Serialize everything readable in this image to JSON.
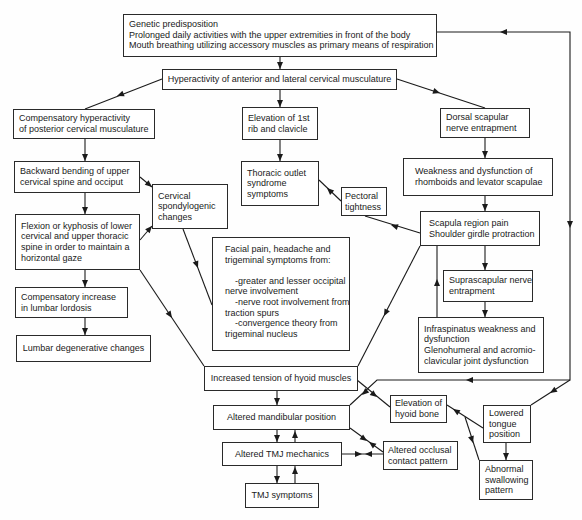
{
  "diagram": {
    "type": "flowchart",
    "boxes": {
      "root_causes": {
        "text": "Genetic predisposition\nProlonged daily activities with the upper extremities in front of the body\nMouth breathing utilizing accessory muscles as primary means of respiration"
      },
      "anterior_hyperactivity": {
        "text": "Hyperactivity of anterior and lateral cervical musculature"
      },
      "posterior_hyperactivity": {
        "text": "Compensatory hyperactivity\nof posterior cervical musculature"
      },
      "rib_elevation": {
        "text": "Elevation of 1st\nrib and clavicle"
      },
      "dorsal_scapular": {
        "text": "Dorsal scapular\nnerve entrapment"
      },
      "backward_bending": {
        "text": "Backward bending of upper\ncervical spine and occiput"
      },
      "thoracic_outlet": {
        "text": "Thoracic outlet\nsyndrome\nsymptoms"
      },
      "cervical_spondylogenic": {
        "text": "Cervical\nspondylogenic\nchanges"
      },
      "pectoral_tightness": {
        "text": "Pectoral\ntightness"
      },
      "rhomboid_weakness": {
        "text": "Weakness and dysfunction of\nrhomboids and levator scapulae"
      },
      "flexion_kyphosis": {
        "text": "Flexion or kyphosis of lower\ncervical and upper thoracic\nspine in order to maintain a\nhorizontal gaze"
      },
      "scapula_pain": {
        "text": "Scapula region pain\nShoulder girdle protraction"
      },
      "facial_pain": {
        "text": "Facial pain, headache and\ntrigeminal symptoms from:\n\n    -greater and lesser occipital\nnerve involvement\n    -nerve root involvement from\ntraction spurs\n    -convergence theory from\ntrigeminal nucleus"
      },
      "lumbar_lordosis": {
        "text": "Compensatory increase\nin lumbar lordosis"
      },
      "suprascapular": {
        "text": "Suprascapular nerve\nentrapment"
      },
      "infraspinatus": {
        "text": "Infraspinatus weakness and\ndysfunction\nGlenohumeral and acromio-\nclavicular joint dysfunction"
      },
      "lumbar_degenerative": {
        "text": "Lumbar degenerative changes"
      },
      "hyoid_tension": {
        "text": "Increased tension of hyoid muscles"
      },
      "mandibular_position": {
        "text": "Altered mandibular position"
      },
      "tmj_mechanics": {
        "text": "Altered TMJ mechanics"
      },
      "tmj_symptoms": {
        "text": "TMJ symptoms"
      },
      "hyoid_elevation": {
        "text": "Elevation of\nhyoid bone"
      },
      "occlusal_pattern": {
        "text": "Altered occlusal\ncontact pattern"
      },
      "lowered_tongue": {
        "text": "Lowered\ntongue\nposition"
      },
      "abnormal_swallowing": {
        "text": "Abnormal\nswallowing\npattern"
      }
    },
    "edges": [
      [
        "root_causes",
        "anterior_hyperactivity"
      ],
      [
        "anterior_hyperactivity",
        "posterior_hyperactivity"
      ],
      [
        "anterior_hyperactivity",
        "rib_elevation"
      ],
      [
        "anterior_hyperactivity",
        "dorsal_scapular"
      ],
      [
        "posterior_hyperactivity",
        "backward_bending"
      ],
      [
        "backward_bending",
        "flexion_kyphosis"
      ],
      [
        "backward_bending",
        "cervical_spondylogenic"
      ],
      [
        "flexion_kyphosis",
        "cervical_spondylogenic"
      ],
      [
        "flexion_kyphosis",
        "lumbar_lordosis"
      ],
      [
        "lumbar_lordosis",
        "lumbar_degenerative"
      ],
      [
        "flexion_kyphosis",
        "hyoid_tension"
      ],
      [
        "cervical_spondylogenic",
        "facial_pain"
      ],
      [
        "rib_elevation",
        "thoracic_outlet"
      ],
      [
        "pectoral_tightness",
        "thoracic_outlet"
      ],
      [
        "scapula_pain",
        "pectoral_tightness"
      ],
      [
        "scapula_pain",
        "hyoid_tension"
      ],
      [
        "dorsal_scapular",
        "rhomboid_weakness"
      ],
      [
        "rhomboid_weakness",
        "scapula_pain"
      ],
      [
        "scapula_pain",
        "suprascapular"
      ],
      [
        "suprascapular",
        "infraspinatus"
      ],
      [
        "infraspinatus",
        "scapula_pain"
      ],
      [
        "hyoid_tension",
        "mandibular_position"
      ],
      [
        "hyoid_tension",
        "hyoid_elevation"
      ],
      [
        "mandibular_position",
        "tmj_mechanics"
      ],
      [
        "tmj_mechanics",
        "mandibular_position"
      ],
      [
        "tmj_mechanics",
        "tmj_symptoms"
      ],
      [
        "tmj_symptoms",
        "tmj_mechanics"
      ],
      [
        "mandibular_position",
        "occlusal_pattern"
      ],
      [
        "occlusal_pattern",
        "mandibular_position"
      ],
      [
        "tmj_mechanics",
        "occlusal_pattern"
      ],
      [
        "occlusal_pattern",
        "tmj_mechanics"
      ],
      [
        "lowered_tongue",
        "hyoid_elevation"
      ],
      [
        "lowered_tongue",
        "abnormal_swallowing"
      ],
      [
        "hyoid_elevation",
        "abnormal_swallowing"
      ],
      [
        "lowered_tongue",
        "root_causes"
      ],
      [
        "root_causes",
        "lowered_tongue"
      ],
      [
        "root_causes",
        "mandibular_position"
      ]
    ]
  }
}
